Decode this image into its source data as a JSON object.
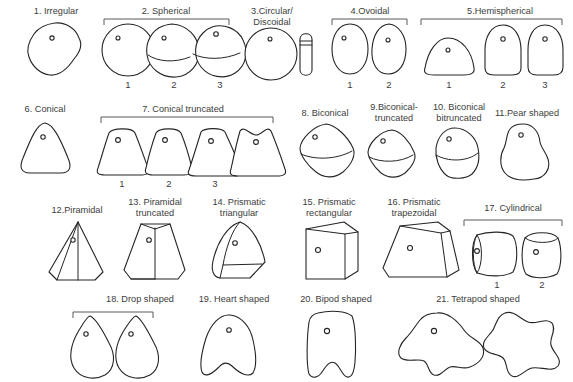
{
  "figure": {
    "background_color": "#ffffff",
    "outline_color": "#252525",
    "text_color": "#3c3c3c",
    "bracket_color": "#5a5a5a",
    "perforation_glyph": "o"
  },
  "groups": [
    {
      "id": "g1",
      "number": "1.",
      "label": "1. Irregular",
      "bracketed": false,
      "variants": []
    },
    {
      "id": "g2",
      "number": "2.",
      "label": "2. Spherical",
      "bracketed": true,
      "variants": [
        "1",
        "2",
        "3"
      ]
    },
    {
      "id": "g3",
      "number": "3.",
      "label": "3.Circular/",
      "label2": "Discoidal",
      "bracketed": false,
      "variants": []
    },
    {
      "id": "g4",
      "number": "4.",
      "label": "4.Ovoidal",
      "bracketed": true,
      "variants": [
        "1",
        "2"
      ]
    },
    {
      "id": "g5",
      "number": "5.",
      "label": "5.Hemispherical",
      "bracketed": true,
      "variants": [
        "1",
        "2",
        "3"
      ]
    },
    {
      "id": "g6",
      "number": "6.",
      "label": "6. Conical",
      "bracketed": false,
      "variants": []
    },
    {
      "id": "g7",
      "number": "7.",
      "label": "7. Conical truncated",
      "bracketed": true,
      "variants": [
        "1",
        "2",
        "3"
      ]
    },
    {
      "id": "g8",
      "number": "8.",
      "label": "8. Biconical",
      "bracketed": false,
      "variants": []
    },
    {
      "id": "g9",
      "number": "9.",
      "label": "9.Biconical-",
      "label2": "truncated",
      "bracketed": false,
      "variants": []
    },
    {
      "id": "g10",
      "number": "10.",
      "label": "10. Biconical",
      "label2": "bitruncated",
      "bracketed": false,
      "variants": []
    },
    {
      "id": "g11",
      "number": "11.",
      "label": "11.Pear shaped",
      "bracketed": false,
      "variants": []
    },
    {
      "id": "g12",
      "number": "12.",
      "label": "12.Piramidal",
      "bracketed": false,
      "variants": []
    },
    {
      "id": "g13",
      "number": "13.",
      "label": "13. Piramidal",
      "label2": "truncated",
      "bracketed": false,
      "variants": []
    },
    {
      "id": "g14",
      "number": "14.",
      "label": "14. Prismatic",
      "label2": "triangular",
      "bracketed": false,
      "variants": []
    },
    {
      "id": "g15",
      "number": "15.",
      "label": "15. Prismatic",
      "label2": "rectangular",
      "bracketed": false,
      "variants": []
    },
    {
      "id": "g16",
      "number": "16.",
      "label": "16. Prismatic",
      "label2": "trapezoidal",
      "bracketed": false,
      "variants": []
    },
    {
      "id": "g17",
      "number": "17.",
      "label": "17. Cylindrical",
      "bracketed": true,
      "variants": [
        "1",
        "2"
      ]
    },
    {
      "id": "g18",
      "number": "18.",
      "label": "18. Drop shaped",
      "bracketed": true,
      "variants": []
    },
    {
      "id": "g19",
      "number": "19.",
      "label": "19. Heart shaped",
      "bracketed": false,
      "variants": []
    },
    {
      "id": "g20",
      "number": "20.",
      "label": "20. Bipod shaped",
      "bracketed": false,
      "variants": []
    },
    {
      "id": "g21",
      "number": "21.",
      "label": "21. Tetrapod shaped",
      "bracketed": false,
      "variants": []
    }
  ],
  "row_labels": {
    "row1": [
      "1. Irregular",
      "2. Spherical",
      "3.Circular/ Discoidal",
      "4.Ovoidal",
      "5.Hemispherical"
    ],
    "row2": [
      "6. Conical",
      "7. Conical truncated",
      "8. Biconical",
      "9.Biconical-truncated",
      "10. Biconical bitruncated",
      "11.Pear shaped"
    ],
    "row3": [
      "12.Piramidal",
      "13. Piramidal truncated",
      "14. Prismatic triangular",
      "15. Prismatic rectangular",
      "16. Prismatic trapezoidal",
      "17. Cylindrical"
    ],
    "row4": [
      "18. Drop shaped",
      "19. Heart shaped",
      "20. Bipod shaped",
      "21. Tetrapod shaped"
    ]
  },
  "variant_numbers": {
    "spherical": [
      "1",
      "2",
      "3"
    ],
    "ovoidal": [
      "1",
      "2"
    ],
    "hemispherical": [
      "1",
      "2",
      "3"
    ],
    "conical_truncated": [
      "1",
      "2",
      "3"
    ],
    "cylindrical": [
      "1",
      "2"
    ]
  }
}
